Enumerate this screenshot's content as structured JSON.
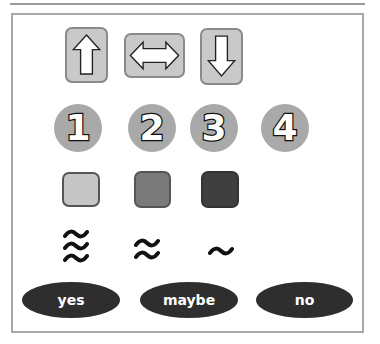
{
  "arrows": [
    {
      "name": "up",
      "icon": "arrow-up-icon"
    },
    {
      "name": "left-right",
      "icon": "arrow-left-right-icon"
    },
    {
      "name": "down",
      "icon": "arrow-down-icon"
    }
  ],
  "numbers": [
    "1",
    "2",
    "3",
    "4"
  ],
  "swatches": [
    {
      "name": "light",
      "color": "#c6c6c6"
    },
    {
      "name": "medium",
      "color": "#7a7a7a"
    },
    {
      "name": "dark",
      "color": "#3f3f3f"
    }
  ],
  "waves": [
    {
      "name": "triple-wave",
      "count": 3
    },
    {
      "name": "double-wave",
      "count": 2
    },
    {
      "name": "single-wave",
      "count": 1
    }
  ],
  "choices": [
    {
      "label": "yes"
    },
    {
      "label": "maybe"
    },
    {
      "label": "no"
    }
  ],
  "colors": {
    "button_fill": "#c9c9c9",
    "circle_fill": "#a9a9a9",
    "pill_fill": "#2e2e2e"
  }
}
